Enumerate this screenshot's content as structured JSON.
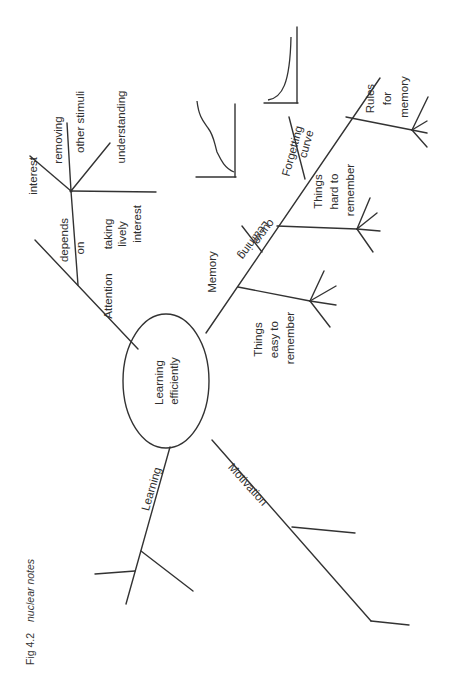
{
  "caption": {
    "figure": "Fig 4.2",
    "title": "nuclear notes"
  },
  "center": {
    "line1": "Learning",
    "line2": "efficiently"
  },
  "branches": {
    "attention": {
      "label": "Attention",
      "sub": {
        "depends": "depends",
        "on": "on",
        "interest": "interest",
        "removing": "removing",
        "other_stimuli": "other stimuli",
        "understanding": "understanding",
        "taking": "taking",
        "lively": "lively",
        "interest2": "interest"
      }
    },
    "memory": {
      "label": "Memory",
      "sub": {
        "easy_1": "Things",
        "easy_2": "easy to",
        "easy_3": "remember",
        "learning_curve_1": "Learning",
        "learning_curve_2": "curve",
        "hard_1": "Things",
        "hard_2": "hard to",
        "hard_3": "remember",
        "forgetting_1": "Forgetting",
        "forgetting_2": "curve",
        "rules_1": "Rules",
        "rules_2": "for",
        "rules_3": "memory"
      }
    },
    "learning": {
      "label": "Learning"
    },
    "motivation": {
      "label": "Motivation"
    }
  }
}
